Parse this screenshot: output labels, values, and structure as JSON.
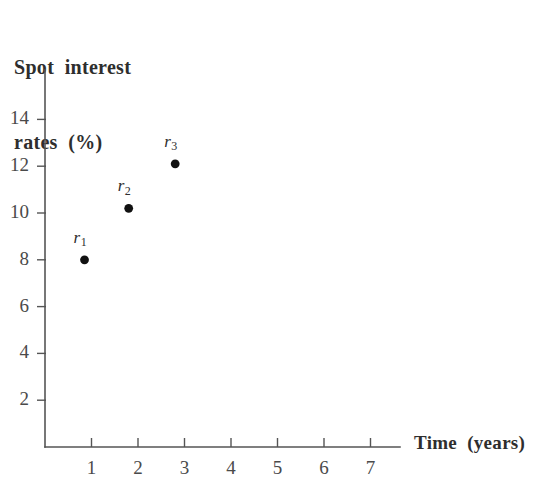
{
  "chart_data": {
    "type": "scatter",
    "title": "",
    "ylabel_lines": [
      "Spot  interest",
      "rates  (%)"
    ],
    "ylabel": "Spot interest rates (%)",
    "xlabel": "Time  (years)",
    "xlim": [
      0,
      7.6
    ],
    "ylim": [
      0,
      16
    ],
    "grid": false,
    "legend": "none",
    "x_ticks": [
      1,
      2,
      3,
      4,
      5,
      6,
      7
    ],
    "x_tick_labels": [
      "1",
      "2",
      "3",
      "4",
      "5",
      "6",
      "7"
    ],
    "y_ticks": [
      2,
      4,
      6,
      8,
      10,
      12,
      14
    ],
    "y_tick_labels": [
      "2",
      "4",
      "6",
      "8",
      "10",
      "12",
      "14"
    ],
    "points": [
      {
        "label": "r",
        "sub": "1",
        "x": 0.85,
        "y": 8.0
      },
      {
        "label": "r",
        "sub": "2",
        "x": 1.8,
        "y": 10.2
      },
      {
        "label": "r",
        "sub": "3",
        "x": 2.8,
        "y": 12.1
      }
    ],
    "marker": "filled-circle",
    "marker_color": "#111111",
    "axis_color": "#555555",
    "background_color": "#ffffff"
  }
}
